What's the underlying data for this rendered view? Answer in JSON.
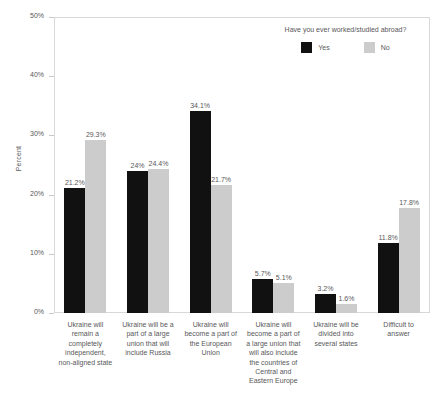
{
  "chart_data": {
    "type": "bar",
    "title": "",
    "xlabel": "",
    "ylabel": "Percent",
    "ylim": [
      0,
      50
    ],
    "ytick_labels": [
      "0%",
      "10%",
      "20%",
      "30%",
      "40%",
      "50%"
    ],
    "ytick_values": [
      0,
      10,
      20,
      30,
      40,
      50
    ],
    "grid": false,
    "legend_position": "top-right",
    "legend_title": "Have you ever worked/studied abroad?",
    "categories": [
      "Ukraine will remain a completely independent, non-aligned state",
      "Ukraine will be a part of a large union that will include Russia",
      "Ukraine will become a part of the European Union",
      "Ukraine will become a part of a large union that will also include the countries of Central and Eastern Europe",
      "Ukraine will be divided into several states",
      "Difficult to answer"
    ],
    "category_lines": [
      [
        "Ukraine will",
        "remain a",
        "completely",
        "independent,",
        "non-aligned state"
      ],
      [
        "Ukraine will be a",
        "part of a large",
        "union that will",
        "include Russia"
      ],
      [
        "Ukraine will",
        "become a part of",
        "the European",
        "Union"
      ],
      [
        "Ukraine will",
        "become a part of",
        "a large union that",
        "will also include",
        "the countries of",
        "Central and",
        "Eastern Europe"
      ],
      [
        "Ukraine will be",
        "divided into",
        "several states"
      ],
      [
        "Difficult to",
        "answer"
      ]
    ],
    "series": [
      {
        "name": "Yes",
        "color": "#111111",
        "values": [
          21.2,
          24.0,
          34.1,
          5.7,
          3.2,
          11.8
        ],
        "labels": [
          "21.2%",
          "24%",
          "34.1%",
          "5.7%",
          "3.2%",
          "11.8%"
        ]
      },
      {
        "name": "No",
        "color": "#cccccc",
        "values": [
          29.3,
          24.4,
          21.7,
          5.1,
          1.6,
          17.8
        ],
        "labels": [
          "29.3%",
          "24.4%",
          "21.7%",
          "5.1%",
          "1.6%",
          "17.8%"
        ]
      }
    ]
  },
  "caption": ""
}
